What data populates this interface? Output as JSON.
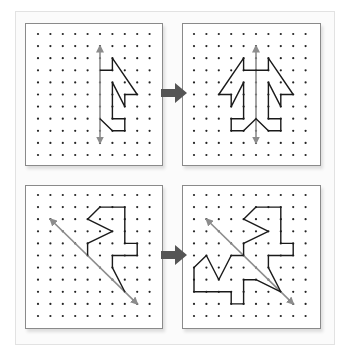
{
  "colors": {
    "shape_stroke": "#1a1a1a",
    "mirror_line": "#8c8c8c",
    "dot": "#222222",
    "transform_arrow": "#555555",
    "panel_border": "#8a8a8a"
  },
  "grid": {
    "columns": 10,
    "rows": 11
  },
  "rows": [
    {
      "name": "vertical-mirror",
      "before": {
        "mirror_line": [
          [
            5,
            1
          ],
          [
            5,
            11
          ]
        ],
        "shape": [
          [
            5,
            3
          ],
          [
            6,
            3
          ],
          [
            6,
            2
          ],
          [
            8,
            5
          ],
          [
            7,
            5
          ],
          [
            7,
            6
          ],
          [
            6,
            4
          ],
          [
            6,
            7
          ],
          [
            7,
            7
          ],
          [
            7,
            8
          ],
          [
            6,
            8
          ],
          [
            5,
            7
          ]
        ]
      },
      "after": {
        "mirror_line": [
          [
            5,
            1
          ],
          [
            5,
            11
          ]
        ],
        "shape": [
          [
            5,
            3
          ],
          [
            6,
            3
          ],
          [
            6,
            2
          ],
          [
            8,
            5
          ],
          [
            7,
            5
          ],
          [
            7,
            6
          ],
          [
            6,
            4
          ],
          [
            6,
            7
          ],
          [
            7,
            7
          ],
          [
            7,
            8
          ],
          [
            6,
            8
          ],
          [
            5,
            7
          ],
          [
            4,
            8
          ],
          [
            3,
            8
          ],
          [
            3,
            7
          ],
          [
            4,
            7
          ],
          [
            4,
            4
          ],
          [
            3,
            6
          ],
          [
            3,
            5
          ],
          [
            2,
            5
          ],
          [
            4,
            2
          ],
          [
            4,
            3
          ],
          [
            5,
            3
          ]
        ]
      }
    },
    {
      "name": "diagonal-mirror",
      "before": {
        "mirror_line": [
          [
            1,
            2
          ],
          [
            8,
            9
          ]
        ],
        "shape": [
          [
            4,
            5
          ],
          [
            4,
            4
          ],
          [
            6,
            3
          ],
          [
            4,
            2
          ],
          [
            5,
            1
          ],
          [
            7,
            1
          ],
          [
            7,
            4
          ],
          [
            8,
            4
          ],
          [
            8,
            5
          ],
          [
            6,
            5
          ],
          [
            6,
            6
          ],
          [
            7,
            8
          ]
        ]
      },
      "after": {
        "mirror_line": [
          [
            1,
            2
          ],
          [
            8,
            9
          ]
        ],
        "shape": [
          [
            4,
            5
          ],
          [
            4,
            4
          ],
          [
            6,
            3
          ],
          [
            4,
            2
          ],
          [
            5,
            1
          ],
          [
            7,
            1
          ],
          [
            7,
            4
          ],
          [
            8,
            4
          ],
          [
            8,
            5
          ],
          [
            6,
            5
          ],
          [
            6,
            6
          ],
          [
            7,
            8
          ],
          [
            5,
            7
          ],
          [
            4,
            7
          ],
          [
            4,
            9
          ],
          [
            3,
            9
          ],
          [
            3,
            8
          ],
          [
            0,
            8
          ],
          [
            0,
            6
          ],
          [
            1,
            5
          ],
          [
            2,
            7
          ],
          [
            3,
            5
          ],
          [
            4,
            5
          ]
        ]
      }
    }
  ]
}
